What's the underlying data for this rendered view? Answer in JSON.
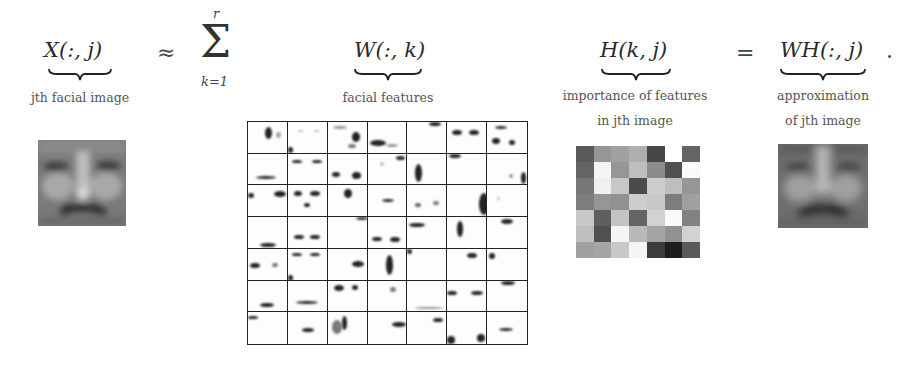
{
  "equation": {
    "lhs": {
      "symbol": "X(:, j)",
      "caption": "jth facial image"
    },
    "approx_operator": "≈",
    "sum": {
      "symbol": "Σ",
      "upper": "r",
      "lower": "k=1"
    },
    "w_term": {
      "symbol": "W(:, k)",
      "caption": "facial features"
    },
    "h_term": {
      "symbol": "H(k, j)",
      "caption_line1": "importance of features",
      "caption_line2": "in jth image"
    },
    "equals_operator": "=",
    "rhs": {
      "symbol": "WH(:, j)",
      "caption_line1": "approximation",
      "caption_line2": "of jth image"
    },
    "terminator": "."
  },
  "w_grid": {
    "rows": 7,
    "cols": 7,
    "description": "49 sparse facial feature basis images"
  },
  "h_matrix": {
    "rows": 7,
    "cols": 7,
    "gray_values": [
      [
        90,
        150,
        160,
        175,
        70,
        255,
        100
      ],
      [
        100,
        245,
        150,
        190,
        140,
        80,
        250
      ],
      [
        120,
        240,
        200,
        75,
        205,
        190,
        150
      ],
      [
        125,
        150,
        145,
        205,
        200,
        125,
        160
      ],
      [
        200,
        95,
        195,
        100,
        210,
        250,
        130
      ],
      [
        190,
        80,
        245,
        185,
        165,
        145,
        210
      ],
      [
        160,
        165,
        200,
        245,
        60,
        30,
        90
      ]
    ]
  },
  "colors": {
    "background": "#ffffff",
    "text": "#2a2a2a",
    "caption": "#555555",
    "grid_line": "#222222"
  }
}
